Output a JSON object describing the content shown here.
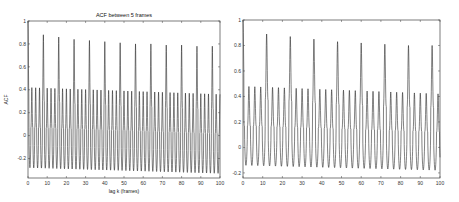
{
  "chart_data": [
    {
      "type": "line",
      "title": "ACF between 5 frames",
      "xlabel": "lag k (frames)",
      "ylabel": "ACF",
      "xlim": [
        0,
        100
      ],
      "ylim": [
        -0.37,
        1
      ],
      "xticks": [
        0,
        10,
        20,
        30,
        40,
        50,
        60,
        70,
        80,
        90,
        100
      ],
      "yticks": [
        -0.2,
        0,
        0.2,
        0.4,
        0.6,
        0.8,
        1
      ],
      "ytick_labels": [
        "-0.2",
        "0",
        "0.2",
        "0.4",
        "0.6",
        "0.8",
        "1"
      ],
      "grid": false,
      "legend": null,
      "description": "Oscillating autocorrelation with period 2 frames; major peaks every 8 frames decaying from ~0.88 to ~0.78; minor peaks ~0.42 decaying to ~0.36; troughs ~-0.30 to -0.33",
      "series": [
        {
          "name": "ACF",
          "period": 2,
          "major_peak_lags": [
            8,
            16,
            24,
            32,
            40,
            48,
            56,
            64,
            72,
            80,
            88,
            96
          ],
          "major_peak_values": [
            0.88,
            0.86,
            0.84,
            0.83,
            0.82,
            0.81,
            0.8,
            0.8,
            0.79,
            0.79,
            0.78,
            0.78
          ],
          "minor_peak_start": 0.42,
          "minor_peak_end": 0.36,
          "trough_start": -0.28,
          "trough_end": -0.33
        }
      ]
    },
    {
      "type": "line",
      "title": "",
      "xlabel": "",
      "ylabel": "",
      "xlim": [
        0,
        100
      ],
      "ylim": [
        -0.24,
        1
      ],
      "xticks": [
        0,
        10,
        20,
        30,
        40,
        50,
        60,
        70,
        80,
        90,
        100
      ],
      "yticks": [
        -0.2,
        0,
        0.2,
        0.4,
        0.6,
        0.8,
        1
      ],
      "ytick_labels": [
        "-0.2",
        "0",
        "0.2",
        "0.4",
        "0.6",
        "0.8",
        "1"
      ],
      "grid": false,
      "legend": null,
      "description": "Oscillating autocorrelation with period 3 frames; major peaks every 12 frames decaying from ~0.89 to ~0.80; minor peaks ~0.48 decaying to ~0.42; troughs ~-0.14 to -0.18",
      "series": [
        {
          "name": "ACF",
          "period": 3,
          "major_peak_lags": [
            12,
            24,
            36,
            48,
            60,
            72,
            84,
            96
          ],
          "major_peak_values": [
            0.89,
            0.87,
            0.85,
            0.83,
            0.82,
            0.81,
            0.8,
            0.8
          ],
          "minor_peak_start": 0.48,
          "minor_peak_end": 0.42,
          "trough_start": -0.14,
          "trough_end": -0.18
        }
      ]
    }
  ]
}
